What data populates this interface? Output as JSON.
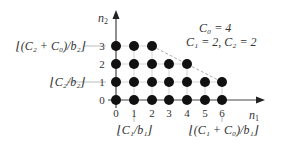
{
  "diagram": {
    "axes": {
      "x_label": "n",
      "x_label_sub": "1",
      "y_label": "n",
      "y_label_sub": "2",
      "x_ticks": [
        "0",
        "1",
        "2",
        "3",
        "4",
        "5",
        "6"
      ],
      "y_ticks": [
        "0",
        "1",
        "2",
        "3"
      ]
    },
    "parameters": {
      "line1": "C₀ = 4",
      "line2": "C₁ = 2, C₂ = 2"
    },
    "y_annotations": [
      {
        "text": "⌊(C₂ + C₀)/b₂⌋",
        "at_tick": "3"
      },
      {
        "text": "⌊C₂/b₂⌋",
        "at_tick": "1"
      }
    ],
    "x_annotations": [
      {
        "text": "⌊C₁/b₁⌋",
        "at_tick": "1"
      },
      {
        "text": "⌊(C₁ + C₀)/b₁⌋",
        "at_tick": "6"
      }
    ],
    "points_per_row": [
      {
        "n2": 0,
        "n1_max": 6
      },
      {
        "n2": 1,
        "n1_max": 6
      },
      {
        "n2": 2,
        "n1_max": 4
      },
      {
        "n2": 3,
        "n1_max": 2
      }
    ],
    "boundary_line": {
      "from": [
        2,
        3
      ],
      "to": [
        6,
        1
      ],
      "style": "dashed"
    },
    "colors": {
      "dot": "#111111",
      "axis": "#555555",
      "grid": "#bbbbbb",
      "boundary": "#999999"
    }
  }
}
